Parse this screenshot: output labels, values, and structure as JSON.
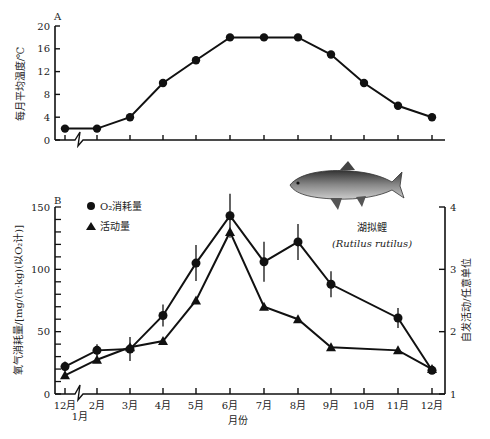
{
  "chart_data": [
    {
      "type": "line",
      "panel": "A",
      "title": "",
      "ylabel": "每月平均温度/℃",
      "xlabel": "",
      "ylim": [
        0,
        20
      ],
      "yticks": [
        0,
        4,
        8,
        12,
        16,
        20
      ],
      "categories": [
        "12月",
        "2月",
        "3月",
        "4月",
        "5月",
        "6月",
        "7月",
        "8月",
        "9月",
        "10月",
        "11月",
        "12月"
      ],
      "series": [
        {
          "name": "温度",
          "marker": "circle",
          "values": [
            2,
            2,
            4,
            10,
            14,
            18,
            18,
            18,
            15,
            10,
            6,
            4
          ]
        }
      ]
    },
    {
      "type": "line",
      "panel": "B",
      "xlabel": "月份",
      "ylabel": "氧气消耗量/[mg/(h·kg)(以O2计)]",
      "ylabel_right": "自发活动/任意单位",
      "ylim": [
        0,
        150
      ],
      "yticks": [
        0,
        50,
        100,
        150
      ],
      "ylim_right": [
        1,
        4
      ],
      "yticks_right": [
        1,
        2,
        3,
        4
      ],
      "categories": [
        "12月",
        "1月",
        "2月",
        "3月",
        "4月",
        "5月",
        "6月",
        "7月",
        "8月",
        "9月",
        "10月",
        "11月",
        "12月"
      ],
      "legend": [
        "O2消耗量",
        "活动量"
      ],
      "annotation": {
        "name_cn": "湖拟鲤",
        "name_latin": "(Rutilus rutilus)"
      },
      "series": [
        {
          "name": "O2消耗量",
          "axis": "left",
          "marker": "circle",
          "error_bars": true,
          "x": [
            "12月",
            "2月",
            "3月",
            "4月",
            "5月",
            "6月",
            "7月",
            "8月",
            "9月",
            "11月",
            "12月"
          ],
          "values": [
            22,
            35,
            36,
            63,
            105,
            143,
            106,
            122,
            88,
            61,
            19
          ]
        },
        {
          "name": "活动量",
          "axis": "right",
          "marker": "triangle",
          "x": [
            "12月",
            "2月",
            "3月",
            "4月",
            "5月",
            "6月",
            "7月",
            "8月",
            "9月",
            "11月",
            "12月"
          ],
          "values": [
            1.3,
            1.55,
            1.75,
            1.85,
            2.5,
            3.6,
            2.4,
            2.2,
            1.75,
            1.7,
            1.4
          ]
        }
      ]
    }
  ],
  "labels": {
    "panel_a": "A",
    "panel_b": "B",
    "a_ylabel": "每月平均温度/℃",
    "b_ylabel": "氧气消耗量/[mg/(h·kg)(以O₂计)]",
    "b_ylabel_right": "自发活动/任意单位",
    "xlabel": "月份",
    "legend_o2": "O₂消耗量",
    "legend_act": "活动量",
    "fish_cn": "湖拟鲤",
    "fish_latin": "(Rutilus rutilus)",
    "month_jan": "1月"
  }
}
